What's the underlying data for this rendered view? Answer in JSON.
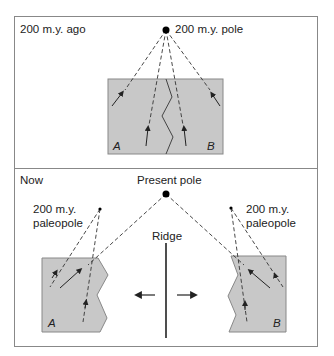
{
  "top_panel": {
    "title": "200 m.y. ago",
    "pole_label": "200 m.y. pole",
    "block_a": "A",
    "block_b": "B"
  },
  "bottom_panel": {
    "title": "Now",
    "pole_label": "Present pole",
    "paleopole_left_line1": "200 m.y.",
    "paleopole_left_line2": "paleopole",
    "paleopole_right_line1": "200 m.y.",
    "paleopole_right_line2": "paleopole",
    "ridge_label": "Ridge",
    "block_a": "A",
    "block_b": "B"
  },
  "colors": {
    "block_fill": "#c8c8c8",
    "block_stroke": "#888888",
    "frame": "#888888",
    "line": "#333333"
  }
}
